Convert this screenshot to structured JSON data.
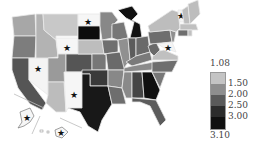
{
  "map": {
    "type": "choropleth",
    "region": "United States",
    "star_marker": "★",
    "colors": {
      "c1": "#f6f6f6",
      "c2": "#bdbdbd",
      "c3": "#8a8a8a",
      "c4": "#5e5e5e",
      "c5": "#2f2f2f",
      "c6": "#0d0d0d"
    }
  },
  "legend": {
    "title": "",
    "labels": [
      "1.08",
      "1.50",
      "2.00",
      "2.50",
      "3.00",
      "3.10"
    ],
    "colors": [
      "#c4c4c4",
      "#8e8e8e",
      "#5a5a5a",
      "#2c2c2c",
      "#101010"
    ]
  }
}
